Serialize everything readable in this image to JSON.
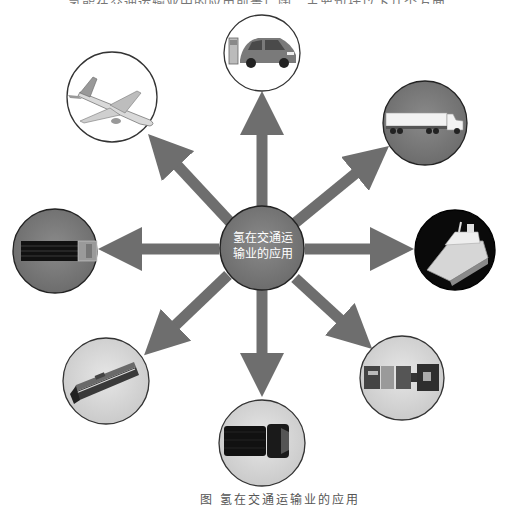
{
  "top_text": "……氢能在交通运输业中的应用前景广阔，主要包括以下几个方面……",
  "center": {
    "line1": "氢在交通运",
    "line2": "输业的应用"
  },
  "nodes": [
    {
      "id": "car",
      "label": "汽车",
      "icon": "car-with-charging-station-icon"
    },
    {
      "id": "truck-top",
      "label": "卡车",
      "icon": "semi-truck-icon"
    },
    {
      "id": "ship",
      "label": "船舶",
      "icon": "ship-icon"
    },
    {
      "id": "truck-bottom",
      "label": "货车",
      "icon": "truck-top-view-icon"
    },
    {
      "id": "pickup",
      "label": "皮卡",
      "icon": "pickup-truck-top-view-icon"
    },
    {
      "id": "train",
      "label": "火车",
      "icon": "train-icon"
    },
    {
      "id": "bus",
      "label": "客车",
      "icon": "bus-top-view-icon"
    },
    {
      "id": "plane",
      "label": "飞机",
      "icon": "airplane-icon"
    }
  ],
  "caption": "图    氢在交通运输业的应用",
  "colors": {
    "arrow": "#6e6e6e",
    "center_fill": "#6b6b6b",
    "circle_stroke": "#333333"
  }
}
